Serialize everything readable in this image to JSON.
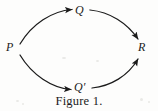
{
  "figure": {
    "caption": "Figure 1.",
    "background_color": "#fdfdfc",
    "ink_color": "#1b1b1b",
    "width": 158,
    "height": 111
  },
  "nodes": [
    {
      "id": "P",
      "label": "P",
      "x": 12,
      "y": 47
    },
    {
      "id": "Q",
      "label": "Q",
      "x": 81,
      "y": 11
    },
    {
      "id": "Qp",
      "label": "Q′",
      "x": 81,
      "y": 87
    },
    {
      "id": "R",
      "label": "R",
      "x": 144,
      "y": 47
    }
  ],
  "edges": [
    {
      "id": "P-to-Q",
      "from": "P",
      "to": "Q",
      "style": "curved-arrow",
      "direction": "up-right"
    },
    {
      "id": "Q-to-R",
      "from": "Q",
      "to": "R",
      "style": "curved-arrow",
      "direction": "down-right"
    },
    {
      "id": "P-to-Qp",
      "from": "P",
      "to": "Qp",
      "style": "curved-arrow",
      "direction": "down-right"
    },
    {
      "id": "Qp-to-R",
      "from": "Qp",
      "to": "R",
      "style": "curved-arrow",
      "direction": "up-right"
    }
  ],
  "diagram_type": "commutative-diagram"
}
